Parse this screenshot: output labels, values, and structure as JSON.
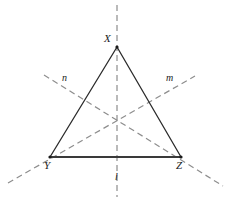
{
  "figure": {
    "type": "geometry-diagram",
    "background_color": "#ffffff",
    "width": 229,
    "height": 204,
    "triangle": {
      "name": "triangle-XYZ",
      "stroke_color": "#2b2b2b",
      "stroke_width": 1.3,
      "base_stroke_width": 2.2,
      "vertices": [
        {
          "label": "X",
          "x": 117,
          "y": 47
        },
        {
          "label": "Y",
          "x": 50,
          "y": 157
        },
        {
          "label": "Z",
          "x": 181,
          "y": 157
        }
      ]
    },
    "symmetry_lines": [
      {
        "label": "l",
        "name": "axis-l-vertical",
        "description": "vertical axis through vertex X and midpoint of YZ",
        "x1": 117,
        "y1": 5,
        "x2": 117,
        "y2": 197,
        "stroke_color": "#8d8d8d",
        "dash": "6 4"
      },
      {
        "label": "m",
        "name": "axis-m",
        "description": "axis through vertex Y rising to the upper right",
        "x1": 8,
        "y1": 183,
        "x2": 195,
        "y2": 76,
        "stroke_color": "#8d8d8d",
        "dash": "6 4"
      },
      {
        "label": "n",
        "name": "axis-n",
        "description": "axis through vertex Z descending to the lower right",
        "x1": 44,
        "y1": 75,
        "x2": 223,
        "y2": 186,
        "stroke_color": "#8d8d8d",
        "dash": "6 4"
      }
    ],
    "centroid": {
      "name": "centroid-point",
      "x": 117,
      "y": 118
    },
    "labels": {
      "vertex_x": "X",
      "vertex_y": "Y",
      "vertex_z": "Z",
      "line_l": "l",
      "line_m": "m",
      "line_n": "n"
    }
  }
}
